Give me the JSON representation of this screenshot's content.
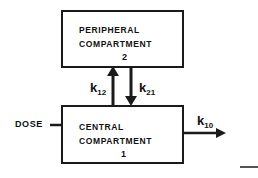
{
  "diagram": {
    "type": "two-compartment pharmacokinetic model",
    "peripheral": {
      "line1": "PERIPHERAL",
      "line2": "COMPARTMENT",
      "number": "2"
    },
    "central": {
      "line1": "CENTRAL",
      "line2": "COMPARTMENT",
      "number": "1"
    },
    "rate_constants": {
      "k12": {
        "base": "k",
        "sub": "12"
      },
      "k21": {
        "base": "k",
        "sub": "21"
      },
      "k10": {
        "base": "k",
        "sub": "10"
      }
    },
    "input_label": "DOSE",
    "colors": {
      "ink": "#1a1a1a",
      "background": "#ffffff"
    }
  }
}
